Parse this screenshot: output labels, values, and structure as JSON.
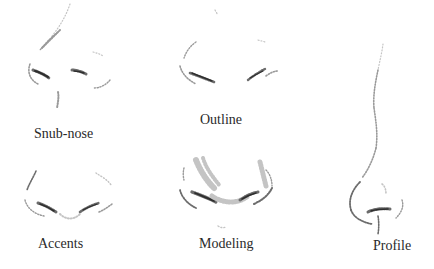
{
  "figure": {
    "panels": [
      {
        "id": "snub-nose",
        "label": "Snub-nose"
      },
      {
        "id": "outline",
        "label": "Outline"
      },
      {
        "id": "accents",
        "label": "Accents"
      },
      {
        "id": "modeling",
        "label": "Modeling"
      },
      {
        "id": "profile",
        "label": "Profile"
      }
    ]
  },
  "colors": {
    "background": "#ffffff",
    "label_text": "#2a2a2a",
    "pencil_dark": "#2e2e2e",
    "pencil_mid": "#6c6c6c",
    "pencil_light": "#9a9a9a"
  }
}
